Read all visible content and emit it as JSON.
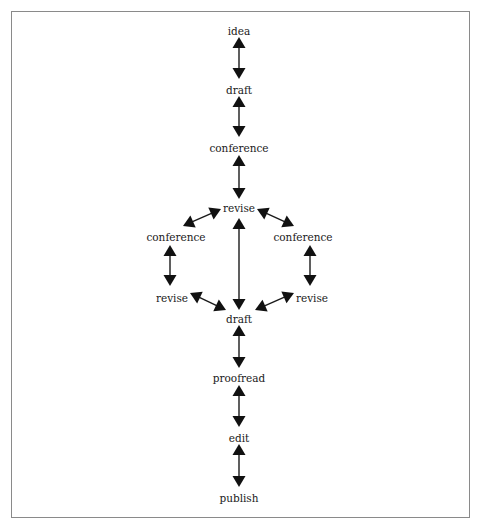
{
  "diagram": {
    "type": "flow",
    "nodes": [
      {
        "id": "idea",
        "label": "idea",
        "x": 239,
        "y": 31
      },
      {
        "id": "draft1",
        "label": "draft",
        "x": 239,
        "y": 90
      },
      {
        "id": "conference1",
        "label": "conference",
        "x": 239,
        "y": 148
      },
      {
        "id": "revise_center",
        "label": "revise",
        "x": 239,
        "y": 208
      },
      {
        "id": "conference_left",
        "label": "conference",
        "x": 176,
        "y": 237
      },
      {
        "id": "conference_right",
        "label": "conference",
        "x": 303,
        "y": 237
      },
      {
        "id": "revise_left",
        "label": "revise",
        "x": 172,
        "y": 298
      },
      {
        "id": "revise_right",
        "label": "revise",
        "x": 312,
        "y": 298
      },
      {
        "id": "draft2",
        "label": "draft",
        "x": 239,
        "y": 319
      },
      {
        "id": "proofread",
        "label": "proofread",
        "x": 239,
        "y": 378
      },
      {
        "id": "edit",
        "label": "edit",
        "x": 239,
        "y": 438
      },
      {
        "id": "publish",
        "label": "publish",
        "x": 239,
        "y": 498
      }
    ],
    "edges": [
      {
        "from": "idea",
        "to": "draft1",
        "bidirectional": true,
        "x1": 239,
        "y1": 37,
        "x2": 239,
        "y2": 79
      },
      {
        "from": "draft1",
        "to": "conference1",
        "bidirectional": true,
        "x1": 239,
        "y1": 96,
        "x2": 239,
        "y2": 137
      },
      {
        "from": "conference1",
        "to": "revise_center",
        "bidirectional": true,
        "x1": 239,
        "y1": 155,
        "x2": 239,
        "y2": 199
      },
      {
        "from": "revise_center",
        "to": "conference_left",
        "bidirectional": true,
        "x1": 221,
        "y1": 209,
        "x2": 183,
        "y2": 226
      },
      {
        "from": "revise_center",
        "to": "conference_right",
        "bidirectional": true,
        "x1": 257,
        "y1": 209,
        "x2": 294,
        "y2": 226
      },
      {
        "from": "conference_left",
        "to": "revise_left",
        "bidirectional": true,
        "x1": 170,
        "y1": 245,
        "x2": 170,
        "y2": 286
      },
      {
        "from": "conference_right",
        "to": "revise_right",
        "bidirectional": true,
        "x1": 310,
        "y1": 245,
        "x2": 310,
        "y2": 286
      },
      {
        "from": "revise_center",
        "to": "draft2",
        "bidirectional": true,
        "x1": 239,
        "y1": 218,
        "x2": 239,
        "y2": 310
      },
      {
        "from": "revise_left",
        "to": "draft2",
        "bidirectional": true,
        "x1": 190,
        "y1": 293,
        "x2": 226,
        "y2": 310
      },
      {
        "from": "revise_right",
        "to": "draft2",
        "bidirectional": true,
        "x1": 294,
        "y1": 293,
        "x2": 255,
        "y2": 310
      },
      {
        "from": "draft2",
        "to": "proofread",
        "bidirectional": true,
        "x1": 239,
        "y1": 325,
        "x2": 239,
        "y2": 368
      },
      {
        "from": "proofread",
        "to": "edit",
        "bidirectional": true,
        "x1": 239,
        "y1": 385,
        "x2": 239,
        "y2": 427
      },
      {
        "from": "edit",
        "to": "publish",
        "bidirectional": true,
        "x1": 239,
        "y1": 444,
        "x2": 239,
        "y2": 487
      }
    ]
  }
}
